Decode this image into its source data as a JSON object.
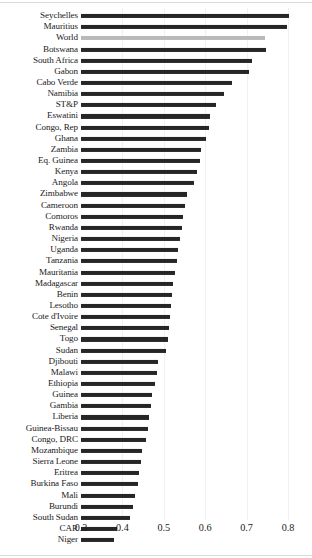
{
  "chart_data": {
    "type": "bar",
    "orientation": "horizontal",
    "title": "",
    "subtitle": "",
    "xlabel": "",
    "ylabel": "",
    "xlim": [
      0.3,
      0.82
    ],
    "baseline": 0.3,
    "grid": false,
    "legend": "none",
    "highlight_category": "World",
    "colors": {
      "bar": "#262626",
      "highlight_bar": "#b9b9b9",
      "text": "#1a1a1a",
      "background": "#ffffff"
    },
    "xticks": [
      0.3,
      0.4,
      0.5,
      0.6,
      0.7,
      0.8
    ],
    "xtick_labels": [
      "0.3",
      "0.4",
      "0.5",
      "0.6",
      "0.7",
      "0.8"
    ],
    "categories": [
      "Seychelles",
      "Mauritius",
      "World",
      "Botswana",
      "South Africa",
      "Gabon",
      "Cabo Verde",
      "Namibia",
      "ST&P",
      "Eswatini",
      "Congo, Rep",
      "Ghana",
      "Zambia",
      "Eq. Guinea",
      "Kenya",
      "Angola",
      "Zimbabwe",
      "Cameroon",
      "Comoros",
      "Rwanda",
      "Nigeria",
      "Uganda",
      "Tanzania",
      "Mauritania",
      "Madagascar",
      "Benin",
      "Lesotho",
      "Cote d'Ivoire",
      "Senegal",
      "Togo",
      "Sudan",
      "Djibouti",
      "Malawi",
      "Ethiopia",
      "Guinea",
      "Gambia",
      "Liberia",
      "Guinea-Bissau",
      "Congo, DRC",
      "Mozambique",
      "Sierra Leone",
      "Eritrea",
      "Burkina Faso",
      "Mali",
      "Burundi",
      "South Sudan",
      "CAR",
      "Niger"
    ],
    "values": [
      0.802,
      0.797,
      0.745,
      0.748,
      0.713,
      0.706,
      0.665,
      0.646,
      0.625,
      0.611,
      0.608,
      0.602,
      0.591,
      0.588,
      0.579,
      0.574,
      0.556,
      0.551,
      0.546,
      0.543,
      0.539,
      0.535,
      0.531,
      0.528,
      0.523,
      0.52,
      0.517,
      0.515,
      0.512,
      0.51,
      0.505,
      0.486,
      0.483,
      0.478,
      0.471,
      0.468,
      0.465,
      0.462,
      0.458,
      0.448,
      0.445,
      0.441,
      0.438,
      0.43,
      0.426,
      0.418,
      0.387,
      0.38
    ],
    "series": [
      {
        "name": "Human Development Index",
        "values": [
          0.802,
          0.797,
          0.745,
          0.748,
          0.713,
          0.706,
          0.665,
          0.646,
          0.625,
          0.611,
          0.608,
          0.602,
          0.591,
          0.588,
          0.579,
          0.574,
          0.556,
          0.551,
          0.546,
          0.543,
          0.539,
          0.535,
          0.531,
          0.528,
          0.523,
          0.52,
          0.517,
          0.515,
          0.512,
          0.51,
          0.505,
          0.486,
          0.483,
          0.478,
          0.471,
          0.468,
          0.465,
          0.462,
          0.458,
          0.448,
          0.445,
          0.441,
          0.438,
          0.43,
          0.426,
          0.418,
          0.387,
          0.38
        ]
      }
    ]
  }
}
